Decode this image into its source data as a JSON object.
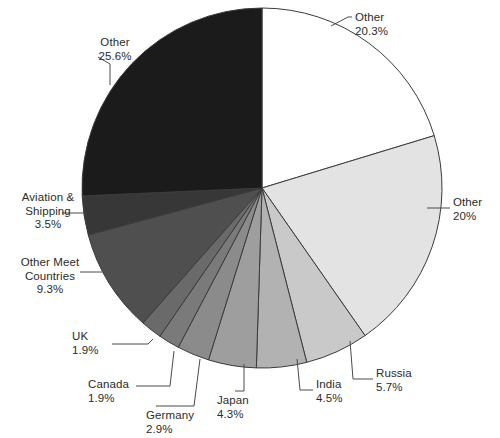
{
  "chart_data": {
    "type": "pie",
    "title": "",
    "subtitle": "",
    "xlabel": "",
    "ylabel": "",
    "legend_position": "none",
    "grid": false,
    "labels_show_percent": true,
    "start_angle_deg": 0,
    "direction": "clockwise",
    "center": {
      "x": 262,
      "y": 188
    },
    "radius": 180,
    "categories": [
      "Other",
      "Other",
      "Russia",
      "India",
      "Japan",
      "Germany",
      "Canada",
      "UK",
      "Other Meet Countries",
      "Aviation & Shipping",
      "Other"
    ],
    "values": [
      20.3,
      20,
      5.7,
      4.5,
      4.3,
      2.9,
      1.9,
      1.9,
      9.3,
      3.5,
      25.6
    ],
    "value_labels": [
      "20.3%",
      "20%",
      "5.7%",
      "4.5%",
      "4.3%",
      "2.9%",
      "1.9%",
      "1.9%",
      "9.3%",
      "3.5%",
      "25.6%"
    ],
    "colors": [
      "#ffffff",
      "#e3e3e3",
      "#c9c9c9",
      "#b2b2b2",
      "#9e9e9e",
      "#8b8b8b",
      "#7a7a7a",
      "#6a6a6a",
      "#4f4f4f",
      "#373737",
      "#1b1b1b"
    ],
    "slice_edge_color": "#3b3b3b",
    "slices": [
      {
        "name": "Other",
        "percent_label": "20.3%",
        "percent": 20.3,
        "color": "#ffffff",
        "start_deg": 0,
        "end_deg": 73.08,
        "label_x": 355,
        "label_y": 11,
        "label_align": "left",
        "leader": "M 331 26 L 348 17 L 352 17"
      },
      {
        "name": "Other",
        "percent_label": "20%",
        "percent": 20,
        "color": "#e3e3e3",
        "start_deg": 73.08,
        "end_deg": 145.08,
        "label_x": 453,
        "label_y": 196,
        "label_align": "left",
        "leader": "M 427 208 L 450 208"
      },
      {
        "name": "Russia",
        "percent_label": "5.7%",
        "percent": 5.7,
        "color": "#c9c9c9",
        "start_deg": 145.08,
        "end_deg": 165.6,
        "label_x": 376,
        "label_y": 367,
        "label_align": "left",
        "leader": "M 350 341 L 353 379 L 373 379"
      },
      {
        "name": "India",
        "percent_label": "4.5%",
        "percent": 4.5,
        "color": "#b2b2b2",
        "start_deg": 165.6,
        "end_deg": 181.8,
        "label_x": 316,
        "label_y": 378,
        "label_align": "left",
        "leader": "M 297 359 L 300 390 L 313 390"
      },
      {
        "name": "Japan",
        "percent_label": "4.3%",
        "percent": 4.3,
        "color": "#9e9e9e",
        "start_deg": 181.8,
        "end_deg": 197.28,
        "label_x": 217,
        "label_y": 394,
        "label_align": "left",
        "leader": "M 244 364 L 244 391 L 235 391"
      },
      {
        "name": "Germany",
        "percent_label": "2.9%",
        "percent": 2.9,
        "color": "#8b8b8b",
        "start_deg": 197.28,
        "end_deg": 207.72,
        "label_x": 146,
        "label_y": 409,
        "label_align": "left",
        "leader": "M 200 359 L 194 406 L 156 406"
      },
      {
        "name": "Canada",
        "percent_label": "1.9%",
        "percent": 1.9,
        "color": "#7a7a7a",
        "start_deg": 207.72,
        "end_deg": 214.56,
        "label_x": 88,
        "label_y": 378,
        "label_align": "left",
        "leader": "M 174 351 L 170 386 L 136 386"
      },
      {
        "name": "UK",
        "percent_label": "1.9%",
        "percent": 1.9,
        "color": "#6a6a6a",
        "start_deg": 214.56,
        "end_deg": 221.4,
        "label_x": 72,
        "label_y": 330,
        "label_align": "left",
        "leader": "M 153 339 L 148 344 L 112 344"
      },
      {
        "name": "Other Meet Countries",
        "percent_label": "9.3%",
        "percent": 9.3,
        "color": "#4f4f4f",
        "start_deg": 221.4,
        "end_deg": 254.88,
        "label_x": 14,
        "label_y": 256,
        "label_align": "right",
        "leader": "M 102 272 L 80 272"
      },
      {
        "name": "Aviation & Shipping",
        "percent_label": "3.5%",
        "percent": 3.5,
        "color": "#373737",
        "start_deg": 254.88,
        "end_deg": 267.48,
        "label_x": 8,
        "label_y": 191,
        "label_align": "right",
        "leader": "M 86 213 L 62 213"
      },
      {
        "name": "Other",
        "percent_label": "25.6%",
        "percent": 25.6,
        "color": "#1b1b1b",
        "start_deg": 267.48,
        "end_deg": 360,
        "label_x": 80,
        "label_y": 36,
        "label_align": "left",
        "leader": "M 110 85 L 110 64 L 98 57"
      }
    ]
  }
}
